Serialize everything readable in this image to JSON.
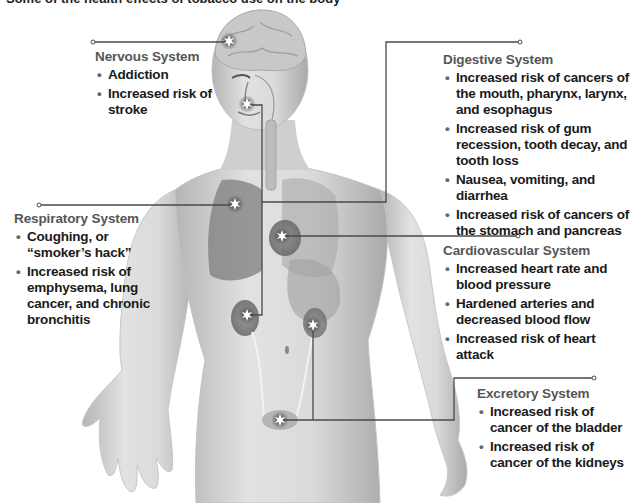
{
  "top_caption": "Some of the health effects of tobacco use on the body",
  "systems": {
    "nervous": {
      "title": "Nervous System",
      "items": [
        "Addiction",
        "Increased risk of stroke"
      ]
    },
    "digestive": {
      "title": "Digestive System",
      "items": [
        "Increased risk of cancers of the mouth, pharynx, larynx, and esophagus",
        "Increased risk of gum recession, tooth decay, and tooth loss",
        "Nausea, vomiting, and diarrhea",
        "Increased risk of cancers of the stomach and pancreas"
      ]
    },
    "respiratory": {
      "title": "Respiratory System",
      "items": [
        "Coughing, or “smoker’s hack”",
        "Increased risk of emphysema, lung cancer, and chronic bronchitis"
      ]
    },
    "cardiovascular": {
      "title": "Cardiovascular System",
      "items": [
        "Increased heart rate and blood pressure",
        "Hardened arteries and decreased blood flow",
        "Increased risk of heart attack"
      ]
    },
    "excretory": {
      "title": "Excretory System",
      "items": [
        "Increased risk of cancer of the bladder",
        "Increased risk of cancer of the kidneys"
      ]
    }
  },
  "bullet_glyph": "•",
  "colors": {
    "heading": "#555555",
    "body_text": "#1a1a1a",
    "connector": "#4a4a4a",
    "skin_light": "#e6e6e6",
    "skin_dark": "#9a9a9a"
  }
}
